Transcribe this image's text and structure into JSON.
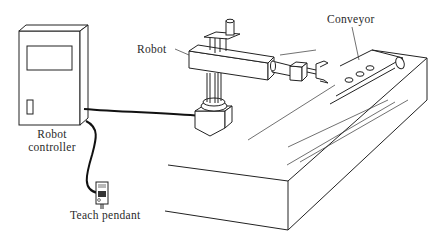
{
  "diagram": {
    "type": "illustration",
    "labels": {
      "robot": "Robot",
      "conveyor": "Conveyor",
      "controller_line1": "Robot",
      "controller_line2": "controller",
      "teach_pendant": "Teach pendant"
    },
    "components": [
      {
        "id": "robot-controller",
        "label": "Robot controller"
      },
      {
        "id": "teach-pendant",
        "label": "Teach pendant"
      },
      {
        "id": "robot",
        "label": "Robot"
      },
      {
        "id": "conveyor",
        "label": "Conveyor"
      }
    ],
    "connections": [
      {
        "from": "robot-controller",
        "to": "robot"
      },
      {
        "from": "robot-controller",
        "to": "teach-pendant"
      }
    ],
    "colors": {
      "line": "#222222",
      "background": "#ffffff"
    }
  }
}
